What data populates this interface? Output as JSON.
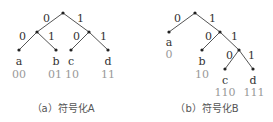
{
  "figure_a": {
    "caption": "（a）符号化A",
    "root_edges": {
      "left": "0",
      "right": "1"
    },
    "left_edges": {
      "left": "0",
      "right": "1"
    },
    "right_edges": {
      "left": "0",
      "right": "1"
    },
    "leaves": [
      {
        "symbol": "a",
        "code": "00"
      },
      {
        "symbol": "b",
        "code": "01"
      },
      {
        "symbol": "c",
        "code": "10"
      },
      {
        "symbol": "d",
        "code": "11"
      }
    ]
  },
  "figure_b": {
    "caption": "（b）符号化B",
    "level1_edges": {
      "left": "0",
      "right": "1"
    },
    "level2_edges": {
      "left": "0",
      "right": "1"
    },
    "level3_edges": {
      "left": "0",
      "right": "1"
    },
    "leaves": [
      {
        "symbol": "a",
        "code": "0"
      },
      {
        "symbol": "b",
        "code": "10"
      },
      {
        "symbol": "c",
        "code": "110"
      },
      {
        "symbol": "d",
        "code": "111"
      }
    ]
  }
}
